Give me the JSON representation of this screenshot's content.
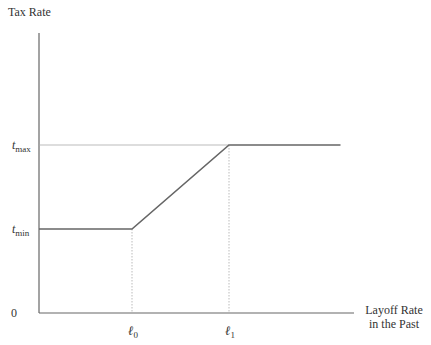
{
  "chart_data": {
    "type": "line",
    "title": "",
    "ylabel": "Tax Rate",
    "xlabel_lines": [
      "Layoff Rate",
      "in the Past"
    ],
    "origin_label": "0",
    "y_ticks": [
      {
        "id": "tmin",
        "base": "t",
        "sub": "min",
        "value": 0.3
      },
      {
        "id": "tmax",
        "base": "t",
        "sub": "max",
        "value": 0.6
      }
    ],
    "x_ticks": [
      {
        "id": "l0",
        "base": "ℓ",
        "sub": "0",
        "value": 1.0
      },
      {
        "id": "l1",
        "base": "ℓ",
        "sub": "1",
        "value": 2.0
      }
    ],
    "xlim": [
      0,
      3.3
    ],
    "ylim": [
      0,
      1.0
    ],
    "series": [
      {
        "name": "tax-schedule",
        "points": [
          [
            0,
            0.3
          ],
          [
            1.0,
            0.3
          ],
          [
            2.0,
            0.6
          ],
          [
            3.15,
            0.6
          ]
        ]
      }
    ],
    "grid": false,
    "colors": {
      "axis": "#666666",
      "line": "#666666",
      "guide": "#aaaaaa"
    }
  }
}
